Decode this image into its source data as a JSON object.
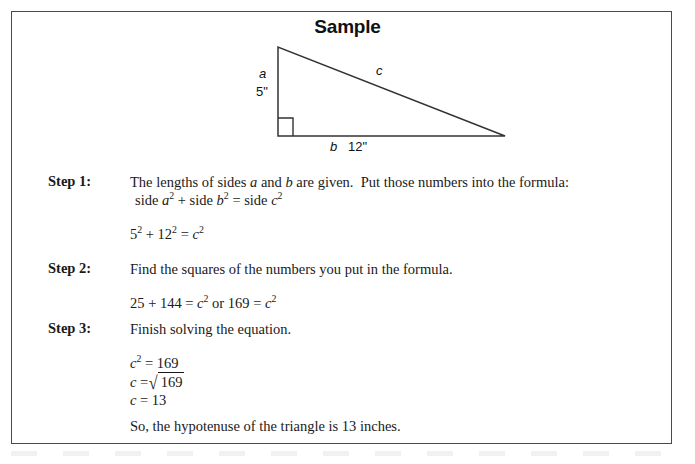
{
  "title": "Sample",
  "figure": {
    "name": "right-triangle-diagram",
    "labels": {
      "leg_a": "a",
      "leg_a_measure": "5\"",
      "hypotenuse_c": "c",
      "leg_b": "b",
      "leg_b_measure": "12\""
    },
    "right_angle_marker": true,
    "colors": {
      "stroke": "#333333",
      "background": "#ffffff"
    }
  },
  "steps": [
    {
      "label": "Step 1:",
      "line1": "The lengths of sides a and b are given.  Put those numbers into the formula:",
      "line2": "side a² + side b² = side c²",
      "math": "5² + 12² = c²"
    },
    {
      "label": "Step 2:",
      "line1": "Find the squares of the numbers you put in the formula.",
      "math": "25 + 144 = c² or 169 = c²"
    },
    {
      "label": "Step 3:",
      "line1": "Finish solving the equation.",
      "math_line1": "c² = 169",
      "math_line2_prefix": "c =",
      "math_line2_radicand": "169",
      "math_line3": "c = 13"
    }
  ],
  "conclusion": "So, the hypotenuse of the triangle is 13 inches.",
  "colors": {
    "border": "#4a4a4a",
    "text": "#1a1a1a",
    "title": "#111111"
  }
}
